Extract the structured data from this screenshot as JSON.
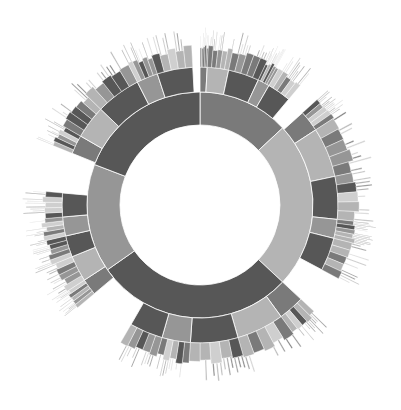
{
  "chart_data": {
    "type": "sunburst",
    "title": "",
    "center": [
      200,
      205
    ],
    "rings": [
      {
        "inner": 80,
        "outer": 113
      },
      {
        "inner": 113,
        "outer": 138
      },
      {
        "inner": 138,
        "outer": 160
      },
      {
        "inner": 160,
        "outer": 178
      }
    ],
    "palette": {
      "dark": "#575757",
      "mid": "#7a7a7a",
      "gray": "#969696",
      "light": "#b4b4b4",
      "pale": "#cfcfcf"
    },
    "level1": [
      {
        "start": 0,
        "end": 47,
        "shade": "mid"
      },
      {
        "start": 47,
        "end": 133,
        "shade": "light"
      },
      {
        "start": 133,
        "end": 235,
        "shade": "dark"
      },
      {
        "start": 235,
        "end": 291,
        "shade": "gray"
      },
      {
        "start": 291,
        "end": 360,
        "shade": "dark"
      }
    ],
    "level2": [
      {
        "start": 0,
        "end": 3,
        "shade": "mid"
      },
      {
        "start": 3,
        "end": 12,
        "shade": "light"
      },
      {
        "start": 12,
        "end": 25,
        "shade": "dark"
      },
      {
        "start": 25,
        "end": 30,
        "shade": "gray"
      },
      {
        "start": 30,
        "end": 40,
        "shade": "dark"
      },
      {
        "start": 48,
        "end": 57,
        "shade": "mid"
      },
      {
        "start": 57,
        "end": 78,
        "shade": "light"
      },
      {
        "start": 78,
        "end": 96,
        "shade": "dark"
      },
      {
        "start": 96,
        "end": 104,
        "shade": "gray"
      },
      {
        "start": 104,
        "end": 118,
        "shade": "dark"
      },
      {
        "start": 133,
        "end": 144,
        "shade": "mid"
      },
      {
        "start": 144,
        "end": 164,
        "shade": "light"
      },
      {
        "start": 164,
        "end": 184,
        "shade": "dark"
      },
      {
        "start": 184,
        "end": 196,
        "shade": "gray"
      },
      {
        "start": 196,
        "end": 210,
        "shade": "dark"
      },
      {
        "start": 230,
        "end": 237,
        "shade": "mid"
      },
      {
        "start": 237,
        "end": 248,
        "shade": "light"
      },
      {
        "start": 248,
        "end": 257,
        "shade": "dark"
      },
      {
        "start": 257,
        "end": 265,
        "shade": "gray"
      },
      {
        "start": 265,
        "end": 275,
        "shade": "dark"
      },
      {
        "start": 292,
        "end": 300,
        "shade": "mid"
      },
      {
        "start": 300,
        "end": 314,
        "shade": "light"
      },
      {
        "start": 314,
        "end": 333,
        "shade": "dark"
      },
      {
        "start": 333,
        "end": 342,
        "shade": "gray"
      },
      {
        "start": 342,
        "end": 357,
        "shade": "dark"
      }
    ],
    "outer_levels": {
      "level3_subdivisions": 5,
      "level4_subdivisions": 3,
      "level3_fill_ratio": 1.0,
      "level4_fill_ratio": 0.6
    }
  }
}
